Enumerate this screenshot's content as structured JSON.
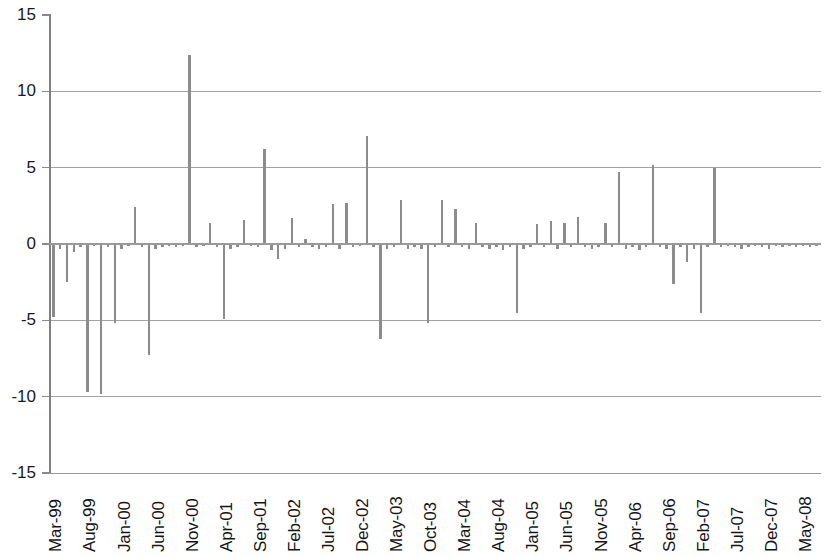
{
  "chart_data": {
    "type": "bar",
    "title": "",
    "subtitle": "",
    "xlabel": "",
    "ylabel": "",
    "ylim": [
      -15,
      15
    ],
    "ytick_labels": [
      "15",
      "10",
      "5",
      "0",
      "-5",
      "-10",
      "-15"
    ],
    "ytick_values": [
      15,
      10,
      5,
      0,
      -5,
      -10,
      -15
    ],
    "grid": "horizontal",
    "legend": "none",
    "x_tick_labels": [
      "Mar-99",
      "Aug-99",
      "Jan-00",
      "Jun-00",
      "Nov-00",
      "Apr-01",
      "Sep-01",
      "Feb-02",
      "Jul-02",
      "Dec-02",
      "May-03",
      "Oct-03",
      "Mar-04",
      "Aug-04",
      "Jan-05",
      "Jun-05",
      "Nov-05",
      "Apr-06",
      "Sep-06",
      "Feb-07",
      "Jul-07",
      "Dec-07",
      "May-08"
    ],
    "x_tick_interval_months": 5,
    "bar_color": "#8c8c8c",
    "axis_color": "#9a9a9a",
    "categories": [
      "Mar-99",
      "Apr-99",
      "May-99",
      "Jun-99",
      "Jul-99",
      "Aug-99",
      "Sep-99",
      "Oct-99",
      "Nov-99",
      "Dec-99",
      "Jan-00",
      "Feb-00",
      "Mar-00",
      "Apr-00",
      "May-00",
      "Jun-00",
      "Jul-00",
      "Aug-00",
      "Sep-00",
      "Oct-00",
      "Nov-00",
      "Dec-00",
      "Jan-01",
      "Feb-01",
      "Mar-01",
      "Apr-01",
      "May-01",
      "Jun-01",
      "Jul-01",
      "Aug-01",
      "Sep-01",
      "Oct-01",
      "Nov-01",
      "Dec-01",
      "Jan-02",
      "Feb-02",
      "Mar-02",
      "Apr-02",
      "May-02",
      "Jun-02",
      "Jul-02",
      "Aug-02",
      "Sep-02",
      "Oct-02",
      "Nov-02",
      "Dec-02",
      "Jan-03",
      "Feb-03",
      "Mar-03",
      "Apr-03",
      "May-03",
      "Jun-03",
      "Jul-03",
      "Aug-03",
      "Sep-03",
      "Oct-03",
      "Nov-03",
      "Dec-03",
      "Jan-04",
      "Feb-04",
      "Mar-04",
      "Apr-04",
      "May-04",
      "Jun-04",
      "Jul-04",
      "Aug-04",
      "Sep-04",
      "Oct-04",
      "Nov-04",
      "Dec-04",
      "Jan-05",
      "Feb-05",
      "Mar-05",
      "Apr-05",
      "May-05",
      "Jun-05",
      "Jul-05",
      "Aug-05",
      "Sep-05",
      "Oct-05",
      "Nov-05",
      "Dec-05",
      "Jan-06",
      "Feb-06",
      "Mar-06",
      "Apr-06",
      "May-06",
      "Jun-06",
      "Jul-06",
      "Aug-06",
      "Sep-06",
      "Oct-06",
      "Nov-06",
      "Dec-06",
      "Jan-07",
      "Feb-07",
      "Mar-07",
      "Apr-07",
      "May-07",
      "Jun-07",
      "Jul-07",
      "Aug-07",
      "Sep-07",
      "Oct-07",
      "Nov-07",
      "Dec-07",
      "Jan-08",
      "Feb-08",
      "Mar-08",
      "Apr-08",
      "May-08",
      "Jun-08",
      "Jul-08"
    ],
    "values": [
      -4.8,
      -0.3,
      -2.5,
      -0.5,
      -0.2,
      -9.7,
      -0.1,
      -9.8,
      -0.2,
      -5.2,
      -0.3,
      -0.1,
      2.4,
      -0.2,
      -7.3,
      -0.3,
      -0.2,
      -0.1,
      -0.2,
      -0.1,
      12.4,
      -0.2,
      -0.1,
      1.4,
      -0.2,
      -4.9,
      -0.3,
      -0.2,
      1.6,
      -0.1,
      -0.2,
      6.2,
      -0.4,
      -1.0,
      -0.3,
      1.7,
      -0.2,
      0.3,
      -0.2,
      -0.3,
      -0.2,
      2.6,
      -0.3,
      2.7,
      -0.2,
      -0.1,
      7.1,
      -0.2,
      -6.2,
      -0.3,
      -0.2,
      2.9,
      -0.3,
      -0.2,
      -0.3,
      -5.2,
      -0.2,
      2.9,
      -0.2,
      2.3,
      -0.2,
      -0.3,
      1.4,
      -0.2,
      -0.3,
      -0.2,
      -0.4,
      -0.2,
      -4.5,
      -0.3,
      -0.2,
      1.3,
      -0.2,
      1.5,
      -0.3,
      1.4,
      -0.2,
      1.8,
      -0.2,
      -0.3,
      -0.2,
      1.4,
      -0.2,
      4.7,
      -0.3,
      -0.2,
      -0.4,
      -0.2,
      5.2,
      -0.2,
      -0.3,
      -2.6,
      -0.2,
      -1.2,
      -0.3,
      -4.5,
      -0.2,
      5.0,
      -0.2,
      -0.1,
      -0.2,
      -0.3,
      -0.2,
      -0.1,
      -0.2,
      -0.3,
      -0.1,
      -0.2,
      -0.1,
      -0.2,
      -0.1,
      -0.2,
      -0.1
    ]
  }
}
